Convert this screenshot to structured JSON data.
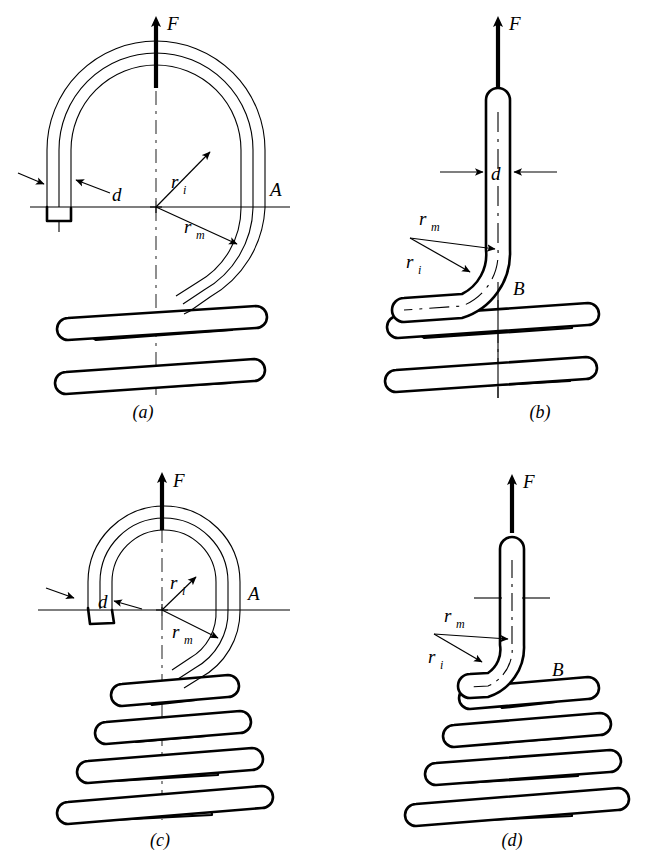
{
  "figure": {
    "background_color": "#ffffff",
    "line_color": "#000000",
    "shade_color": "#c8c8c8"
  },
  "panels": [
    {
      "id": "a",
      "caption": "(a)",
      "caption_x": 143,
      "caption_y": 418,
      "force_label": "F",
      "labels": {
        "diameter": "d",
        "inner_radius": "r",
        "inner_radius_sub": "i",
        "mean_radius": "r",
        "mean_radius_sub": "m",
        "section": "A"
      },
      "coil_turns": 2,
      "hook_type": "full-loop-large-radius"
    },
    {
      "id": "b",
      "caption": "(b)",
      "caption_x": 540,
      "caption_y": 418,
      "force_label": "F",
      "labels": {
        "diameter": "d",
        "inner_radius": "r",
        "inner_radius_sub": "i",
        "mean_radius": "r",
        "mean_radius_sub": "m",
        "section": "B"
      },
      "coil_turns": 2,
      "hook_type": "bent-up-end"
    },
    {
      "id": "c",
      "caption": "(c)",
      "caption_x": 160,
      "caption_y": 846,
      "force_label": "F",
      "labels": {
        "diameter": "d",
        "inner_radius": "r",
        "inner_radius_sub": "i",
        "mean_radius": "r",
        "mean_radius_sub": "m",
        "section": "A"
      },
      "coil_turns": 4,
      "hook_type": "full-loop-small-radius"
    },
    {
      "id": "d",
      "caption": "(d)",
      "caption_x": 512,
      "caption_y": 846,
      "force_label": "F",
      "labels": {
        "inner_radius": "r",
        "inner_radius_sub": "i",
        "mean_radius": "r",
        "mean_radius_sub": "m",
        "section": "B"
      },
      "coil_turns": 4,
      "hook_type": "bent-up-end-tapered"
    }
  ]
}
